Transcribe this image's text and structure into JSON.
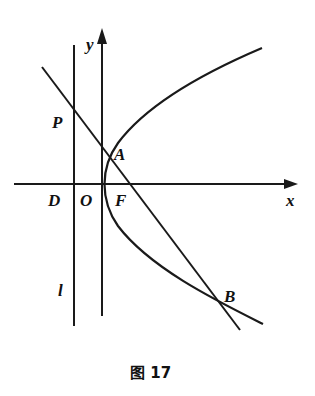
{
  "figure": {
    "caption": "图 17",
    "stroke_color": "#1a1a1a",
    "background": "#ffffff"
  },
  "labels": {
    "x_axis": "x",
    "y_axis": "y",
    "origin": "O",
    "point_D": "D",
    "point_F": "F",
    "point_P": "P",
    "point_A": "A",
    "point_B": "B",
    "line_l": "l"
  },
  "elements": {
    "x_axis": {
      "from": [
        14,
        184
      ],
      "to": [
        298,
        184
      ],
      "arrow": true
    },
    "y_axis": {
      "from": [
        102,
        316
      ],
      "to": [
        102,
        28
      ],
      "arrow": true
    },
    "directrix_l": {
      "from": [
        74,
        45
      ],
      "to": [
        74,
        326
      ]
    },
    "secant_line": {
      "from": [
        42,
        67
      ],
      "to": [
        240,
        330
      ]
    },
    "parabola": {
      "type": "parabola opening right",
      "vertex": [
        102,
        184
      ],
      "upper_end": [
        262,
        48
      ],
      "lower_end": [
        263,
        324
      ]
    },
    "points": {
      "P": [
        74,
        108
      ],
      "A": [
        110,
        156
      ],
      "F": [
        130,
        184
      ],
      "B": [
        222,
        304
      ],
      "D": [
        74,
        184
      ],
      "O": [
        102,
        184
      ]
    }
  }
}
